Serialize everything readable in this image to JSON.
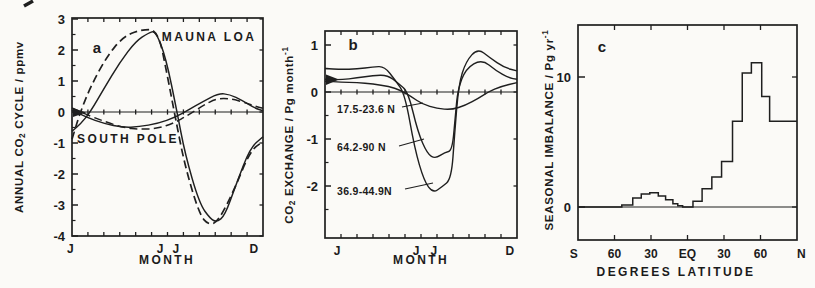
{
  "figure": {
    "background": "#fbfaf7",
    "ink": "#1f1f1f"
  },
  "panels": {
    "a": {
      "letter": "a",
      "xlabel": "MONTH",
      "ylabel": {
        "pre": "ANNUAL CO",
        "sub": "2",
        "post": " CYCLE / ppmv"
      },
      "yticklabels": [
        {
          "v": 3,
          "text": "3"
        },
        {
          "v": 2,
          "text": "2"
        },
        {
          "v": 1,
          "text": "1"
        },
        {
          "v": 0,
          "text": "0"
        },
        {
          "v": -1,
          "text": "-1"
        },
        {
          "v": -2,
          "text": "-2"
        },
        {
          "v": -3,
          "text": "-3"
        },
        {
          "v": -4,
          "text": "-4"
        }
      ],
      "xticklabels": [
        {
          "pos": -0.1,
          "text": "J"
        },
        {
          "pos": 5.53,
          "text": "J"
        },
        {
          "pos": 6.53,
          "text": "J"
        },
        {
          "pos": 11.43,
          "text": "D"
        }
      ],
      "curve_labels": {
        "mauna_loa": "MAUNA LOA",
        "south_pole": "SOUTH POLE"
      }
    },
    "b": {
      "letter": "b",
      "xlabel": "MONTH",
      "ylabel": {
        "pre": "CO",
        "sub": "2",
        "post": " EXCHANGE / Pg month",
        "sup": "-1"
      },
      "yticklabels": [
        {
          "v": 1,
          "text": "1"
        },
        {
          "v": 0,
          "text": "0"
        },
        {
          "v": -1,
          "text": "-1"
        },
        {
          "v": -2,
          "text": "-2"
        }
      ],
      "xticklabels": [
        {
          "pos": 0.75,
          "text": "J"
        },
        {
          "pos": 5.7,
          "text": "J"
        },
        {
          "pos": 6.8,
          "text": "J"
        },
        {
          "pos": 11.55,
          "text": "D"
        }
      ],
      "band_labels": [
        {
          "text": "17.5-23.6 N"
        },
        {
          "text": "64.2-90 N"
        },
        {
          "text": "36.9-44.9N"
        }
      ]
    },
    "c": {
      "letter": "c",
      "xlabel": "DEGREES LATITUDE",
      "ylabel": {
        "pre": "SEASONAL IMBALANCE / Pg yr",
        "sup": "-1"
      },
      "yticklabels": [
        {
          "v": 10,
          "text": "10"
        },
        {
          "v": 0,
          "text": "0"
        }
      ],
      "xticklabels": [
        {
          "lat": -93.5,
          "text": "S"
        },
        {
          "lat": -60,
          "text": "60"
        },
        {
          "lat": -30,
          "text": "30"
        },
        {
          "lat": 0,
          "text": "EQ"
        },
        {
          "lat": 30,
          "text": "30"
        },
        {
          "lat": 60,
          "text": "60"
        },
        {
          "lat": 93.5,
          "text": "N"
        }
      ]
    }
  },
  "chart_data": [
    {
      "panel": "a",
      "type": "line",
      "xlabel": "MONTH",
      "ylabel": "ANNUAL CO2 CYCLE / ppmv",
      "ylim": [
        -4,
        3
      ],
      "x_axis": "months, 0 = Jan through 12 = end of Dec, tick each month",
      "xtick_labels": [
        "J",
        "J",
        "J",
        "D"
      ],
      "series": [
        {
          "name": "Mauna Loa",
          "style": "solid",
          "points": [
            [
              0,
              -0.62
            ],
            [
              0.55,
              -0.38
            ],
            [
              1.15,
              0
            ],
            [
              2,
              0.75
            ],
            [
              3,
              1.6
            ],
            [
              4,
              2.28
            ],
            [
              4.8,
              2.55
            ],
            [
              5.25,
              2.62
            ],
            [
              5.9,
              1.75
            ],
            [
              6.6,
              0
            ],
            [
              7.1,
              -1.35
            ],
            [
              8,
              -2.95
            ],
            [
              8.7,
              -3.45
            ],
            [
              9.1,
              -3.55
            ],
            [
              9.6,
              -3.35
            ],
            [
              10.3,
              -2.35
            ],
            [
              11.2,
              -1.15
            ],
            [
              12,
              -0.8
            ]
          ]
        },
        {
          "name": "Mauna Loa",
          "style": "dashed",
          "points": [
            [
              0,
              -0.88
            ],
            [
              0.52,
              0
            ],
            [
              1.2,
              0.85
            ],
            [
              2.2,
              1.8
            ],
            [
              3.2,
              2.42
            ],
            [
              4.3,
              2.66
            ],
            [
              5.4,
              2.66
            ],
            [
              6.0,
              1.15
            ],
            [
              6.5,
              -0.2
            ],
            [
              7.1,
              -1.75
            ],
            [
              8,
              -3.3
            ],
            [
              8.6,
              -3.66
            ],
            [
              9.2,
              -3.52
            ],
            [
              10.2,
              -2.5
            ],
            [
              11.2,
              -1.25
            ],
            [
              12,
              -0.95
            ]
          ]
        },
        {
          "name": "South Pole",
          "style": "solid",
          "points": [
            [
              0,
              0.06
            ],
            [
              0.9,
              -0.17
            ],
            [
              2,
              -0.37
            ],
            [
              3.2,
              -0.5
            ],
            [
              4.2,
              -0.48
            ],
            [
              5.4,
              -0.37
            ],
            [
              6.5,
              -0.17
            ],
            [
              7.3,
              0.06
            ],
            [
              8.2,
              0.33
            ],
            [
              9.2,
              0.6
            ],
            [
              9.9,
              0.57
            ],
            [
              10.7,
              0.37
            ],
            [
              11.5,
              0.12
            ],
            [
              12,
              0.04
            ]
          ]
        },
        {
          "name": "South Pole",
          "style": "dashed",
          "points": [
            [
              0,
              0.13
            ],
            [
              0.9,
              -0.08
            ],
            [
              2,
              -0.3
            ],
            [
              3.2,
              -0.5
            ],
            [
              4.3,
              -0.56
            ],
            [
              5.4,
              -0.53
            ],
            [
              6.4,
              -0.36
            ],
            [
              7.3,
              -0.1
            ],
            [
              8.2,
              0.2
            ],
            [
              9.1,
              0.44
            ],
            [
              10,
              0.43
            ],
            [
              10.9,
              0.3
            ],
            [
              11.6,
              0.17
            ],
            [
              12,
              0.12
            ]
          ]
        }
      ]
    },
    {
      "panel": "b",
      "type": "line",
      "xlabel": "MONTH",
      "ylabel": "CO2 EXCHANGE / Pg month-1",
      "ylim": [
        -3.1,
        1.3
      ],
      "x_axis": "months, 0 = Jan through 12 = end of Dec, tick each month",
      "xtick_labels": [
        "J",
        "J",
        "J",
        "D"
      ],
      "series": [
        {
          "name": "17.5-23.6 N",
          "style": "solid",
          "points": [
            [
              0,
              0.23
            ],
            [
              1,
              0.21
            ],
            [
              2,
              0.2
            ],
            [
              3,
              0.17
            ],
            [
              4,
              0.12
            ],
            [
              4.7,
              0.04
            ],
            [
              5.4,
              -0.1
            ],
            [
              6.1,
              -0.26
            ],
            [
              7,
              -0.35
            ],
            [
              7.9,
              -0.38
            ],
            [
              8.8,
              -0.28
            ],
            [
              9.6,
              -0.13
            ],
            [
              10.2,
              0
            ],
            [
              11,
              0.12
            ],
            [
              12,
              0.2
            ]
          ]
        },
        {
          "name": "64.2-90 N",
          "style": "solid",
          "points": [
            [
              0,
              0.27
            ],
            [
              1,
              0.26
            ],
            [
              2,
              0.3
            ],
            [
              3,
              0.35
            ],
            [
              3.9,
              0.36
            ],
            [
              4.6,
              0.18
            ],
            [
              5.2,
              0
            ],
            [
              5.8,
              -0.85
            ],
            [
              6.4,
              -1.32
            ],
            [
              6.9,
              -1.42
            ],
            [
              7.5,
              -1.28
            ],
            [
              7.95,
              -1.25
            ],
            [
              8.15,
              -0.5
            ],
            [
              8.3,
              0.05
            ],
            [
              8.8,
              0.5
            ],
            [
              9.8,
              0.7
            ],
            [
              10.7,
              0.45
            ],
            [
              11.5,
              0.3
            ],
            [
              12,
              0.27
            ]
          ]
        },
        {
          "name": "36.9-44.9N",
          "style": "solid",
          "points": [
            [
              0,
              0.5
            ],
            [
              1,
              0.48
            ],
            [
              2,
              0.49
            ],
            [
              3,
              0.53
            ],
            [
              3.7,
              0.55
            ],
            [
              4.4,
              0.25
            ],
            [
              5,
              -0.05
            ],
            [
              5.6,
              -1.2
            ],
            [
              6.2,
              -1.9
            ],
            [
              6.75,
              -2.15
            ],
            [
              7.3,
              -2.02
            ],
            [
              7.9,
              -1.85
            ],
            [
              8.1,
              -0.9
            ],
            [
              8.35,
              0.15
            ],
            [
              8.8,
              0.65
            ],
            [
              9.55,
              0.93
            ],
            [
              10.3,
              0.73
            ],
            [
              11.2,
              0.52
            ],
            [
              12,
              0.45
            ]
          ]
        }
      ]
    },
    {
      "panel": "c",
      "type": "step",
      "xlabel": "DEGREES LATITUDE",
      "ylabel": "SEASONAL IMBALANCE / Pg yr-1",
      "ylim": [
        -2.5,
        14
      ],
      "xlim": [
        -90,
        90
      ],
      "xtick_labels": [
        "S",
        "60",
        "30",
        "EQ",
        "30",
        "60",
        "N"
      ],
      "steps": [
        {
          "lat_from": -90,
          "lat_to": -54,
          "value": 0
        },
        {
          "lat_from": -54,
          "lat_to": -45,
          "value": 0.15
        },
        {
          "lat_from": -45,
          "lat_to": -38,
          "value": 0.7
        },
        {
          "lat_from": -38,
          "lat_to": -31,
          "value": 1.0
        },
        {
          "lat_from": -31,
          "lat_to": -24,
          "value": 1.1
        },
        {
          "lat_from": -24,
          "lat_to": -18,
          "value": 0.85
        },
        {
          "lat_from": -18,
          "lat_to": -12,
          "value": 0.55
        },
        {
          "lat_from": -12,
          "lat_to": -8,
          "value": 0.25
        },
        {
          "lat_from": -8,
          "lat_to": -4,
          "value": 0.1
        },
        {
          "lat_from": -4,
          "lat_to": 4.5,
          "value": 0
        },
        {
          "lat_from": 4.5,
          "lat_to": 12,
          "value": 0.45
        },
        {
          "lat_from": 12,
          "lat_to": 20,
          "value": 1.4
        },
        {
          "lat_from": 20,
          "lat_to": 28,
          "value": 2.3
        },
        {
          "lat_from": 28,
          "lat_to": 37,
          "value": 3.5
        },
        {
          "lat_from": 37,
          "lat_to": 45,
          "value": 6.6
        },
        {
          "lat_from": 45,
          "lat_to": 52.5,
          "value": 10.3
        },
        {
          "lat_from": 52.5,
          "lat_to": 61,
          "value": 11.1
        },
        {
          "lat_from": 61,
          "lat_to": 67.5,
          "value": 8.5
        },
        {
          "lat_from": 67.5,
          "lat_to": 90,
          "value": 6.6
        }
      ]
    }
  ]
}
